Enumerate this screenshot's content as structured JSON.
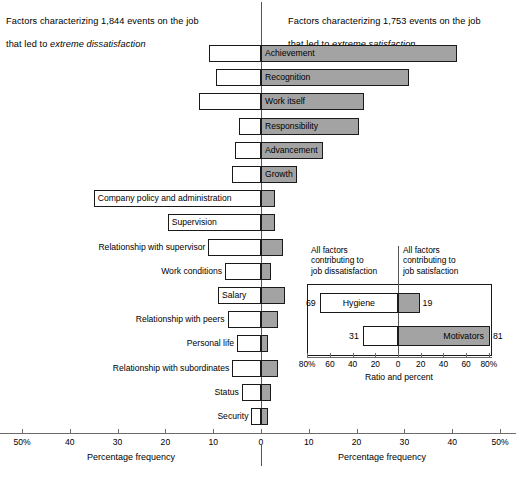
{
  "headers": {
    "left_line1": "Factors characterizing 1,844 events on the job",
    "left_line2_pre": "that led to ",
    "left_line2_em": "extreme dissatisfaction",
    "right_line1": "Factors characterizing 1,753 events on the job",
    "right_line2_pre": "that led to ",
    "right_line2_em": "extreme satisfaction"
  },
  "axis": {
    "left_title": "Percentage frequency",
    "right_title": "Percentage frequency",
    "ticks": [
      "50%",
      "40",
      "30",
      "20",
      "10",
      "0",
      "10",
      "20",
      "30",
      "40",
      "50%"
    ]
  },
  "colors": {
    "satisfaction_fill": "#a3a3a3",
    "dissatisfaction_fill": "#ffffff",
    "outline": "#1a1a1a",
    "axis": "#6b6b6b"
  },
  "chart_data": {
    "type": "bar",
    "xlabel": "Percentage frequency",
    "ylabel": "",
    "xlim": [
      -50,
      50
    ],
    "grid": false,
    "orientation": "horizontal",
    "legend": [
      "Factors characterizing 1,844 events on the job that led to extreme dissatisfaction",
      "Factors characterizing 1,753 events on the job that led to extreme satisfaction"
    ],
    "categories": [
      "Achievement",
      "Recognition",
      "Work itself",
      "Responsibility",
      "Advancement",
      "Growth",
      "Company policy and administration",
      "Supervision",
      "Relationship with supervisor",
      "Work conditions",
      "Salary",
      "Relationship with peers",
      "Personal life",
      "Relationship with subordinates",
      "Status",
      "Security"
    ],
    "series": [
      {
        "name": "Dissatisfaction (left, percent)",
        "values": [
          10.8,
          9.5,
          13.0,
          4.5,
          5.5,
          6.0,
          35.0,
          19.5,
          11.0,
          7.5,
          9.0,
          7.0,
          5.0,
          6.0,
          4.0,
          2.0
        ]
      },
      {
        "name": "Satisfaction (right, percent)",
        "values": [
          41.0,
          31.0,
          21.5,
          20.5,
          13.0,
          7.5,
          3.0,
          3.0,
          4.5,
          2.0,
          5.0,
          3.5,
          1.5,
          3.5,
          2.0,
          1.5
        ]
      }
    ]
  },
  "bars": [
    {
      "label": "Achievement",
      "label_pos": "in-right",
      "neg": 10.8,
      "pos": 41.0
    },
    {
      "label": "Recognition",
      "label_pos": "in-right",
      "neg": 9.5,
      "pos": 31.0
    },
    {
      "label": "Work itself",
      "label_pos": "in-right",
      "neg": 13.0,
      "pos": 21.5
    },
    {
      "label": "Responsibility",
      "label_pos": "in-right",
      "neg": 4.5,
      "pos": 20.5
    },
    {
      "label": "Advancement",
      "label_pos": "in-right",
      "neg": 5.5,
      "pos": 13.0
    },
    {
      "label": "Growth",
      "label_pos": "in-right",
      "neg": 6.0,
      "pos": 7.5
    },
    {
      "label": "Company policy and administration",
      "label_pos": "in-left",
      "neg": 35.0,
      "pos": 3.0
    },
    {
      "label": "Supervision",
      "label_pos": "in-left",
      "neg": 19.5,
      "pos": 3.0
    },
    {
      "label": "Relationship with supervisor",
      "label_pos": "out-left",
      "neg": 11.0,
      "pos": 4.5
    },
    {
      "label": "Work conditions",
      "label_pos": "out-left",
      "neg": 7.5,
      "pos": 2.0
    },
    {
      "label": "Salary",
      "label_pos": "in-left",
      "neg": 9.0,
      "pos": 5.0
    },
    {
      "label": "Relationship with peers",
      "label_pos": "out-left",
      "neg": 7.0,
      "pos": 3.5
    },
    {
      "label": "Personal life",
      "label_pos": "out-left",
      "neg": 5.0,
      "pos": 1.5
    },
    {
      "label": "Relationship with subordinates",
      "label_pos": "out-left",
      "neg": 6.0,
      "pos": 3.5
    },
    {
      "label": "Status",
      "label_pos": "out-left",
      "neg": 4.0,
      "pos": 2.0
    },
    {
      "label": "Security",
      "label_pos": "out-left",
      "neg": 2.0,
      "pos": 1.5
    }
  ],
  "inset": {
    "caption_left": "All factors\ncontributing to\njob dissatisfaction",
    "caption_right": "All factors\ncontributing to\njob satisfaction",
    "axis_title": "Ratio and percent",
    "ticks": [
      "80%",
      "60",
      "40",
      "20",
      "0",
      "20",
      "40",
      "60",
      "80%"
    ],
    "rows": [
      {
        "label": "Hygiene",
        "label_pos": "in-left",
        "neg": 69,
        "pos": 19,
        "neg_text": "69",
        "pos_text": "19"
      },
      {
        "label": "Motivators",
        "label_pos": "in-right",
        "neg": 31,
        "pos": 81,
        "neg_text": "31",
        "pos_text": "81"
      }
    ]
  }
}
